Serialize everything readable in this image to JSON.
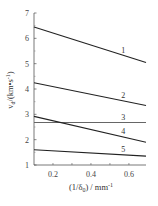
{
  "chart_data": {
    "type": "line",
    "title": "",
    "xlabel": "(1/δ0) / mm⁻¹",
    "ylabel": "vd / (km·s⁻¹)",
    "xlim": [
      0.1,
      0.69
    ],
    "ylim": [
      1,
      7
    ],
    "xticks": [
      0.2,
      0.4,
      0.6
    ],
    "xtick_labels": [
      "0.2",
      "0.4",
      "0.6"
    ],
    "yticks": [
      1,
      2,
      3,
      4,
      5,
      6,
      7
    ],
    "ytick_labels": [
      "1",
      "2",
      "3",
      "4",
      "5",
      "6",
      "7"
    ],
    "grid": false,
    "legend": "inline numeric labels near right end of lines",
    "series": [
      {
        "name": "1",
        "x": [
          0.1,
          0.69
        ],
        "values": [
          6.45,
          5.05
        ]
      },
      {
        "name": "2",
        "x": [
          0.1,
          0.69
        ],
        "values": [
          4.25,
          3.35
        ]
      },
      {
        "name": "3",
        "x": [
          0.1,
          0.69
        ],
        "values": [
          2.68,
          2.68
        ]
      },
      {
        "name": "4",
        "x": [
          0.1,
          0.69
        ],
        "values": [
          2.92,
          1.9
        ]
      },
      {
        "name": "5",
        "x": [
          0.1,
          0.69
        ],
        "values": [
          1.6,
          1.35
        ]
      }
    ]
  },
  "labels": {
    "x_axis": "(1/δ",
    "x_axis_sub": "0",
    "x_axis_tail": ") / mm",
    "x_axis_sup": "-1",
    "y_axis": "v",
    "y_axis_sub": "d",
    "y_axis_tail": "/(km•s",
    "y_axis_sup": "-1",
    "y_axis_close": ")"
  }
}
